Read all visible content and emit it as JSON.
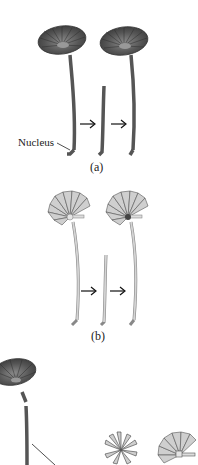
{
  "figure": {
    "panels": [
      {
        "id": "a",
        "label": "(a)",
        "callout": "Nucleus",
        "cap_style": "dark",
        "stages": [
          "intact-cell",
          "cut-stalk",
          "regenerated-cell"
        ],
        "arrows": [
          "→",
          "→"
        ]
      },
      {
        "id": "b",
        "label": "(b)",
        "cap_style": "light",
        "stages": [
          "intact-cell",
          "cut-stalk",
          "regenerated-cell"
        ],
        "arrows": [
          "→",
          "→"
        ]
      },
      {
        "id": "c",
        "cap_style": "mixed",
        "stages": [
          "dark-cap-cell-with-cut-stalk",
          "intermediate-cap",
          "light-cap"
        ]
      }
    ],
    "colors": {
      "dark_cap": "#4a4a4a",
      "dark_stalk": "#6a6a6a",
      "light_cap": "#c8c8c8",
      "light_stalk": "#d0d0d0",
      "outline": "#333333"
    }
  }
}
